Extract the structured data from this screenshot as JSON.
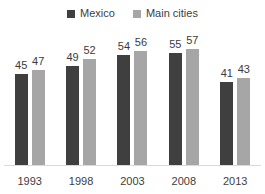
{
  "chart_data": {
    "type": "bar",
    "title": "",
    "categories": [
      "1993",
      "1998",
      "2003",
      "2008",
      "2013"
    ],
    "series": [
      {
        "name": "Mexico",
        "color": "#3f3f3f",
        "values": [
          45,
          49,
          54,
          55,
          41
        ]
      },
      {
        "name": "Main cities",
        "color": "#a6a6a6",
        "values": [
          47,
          52,
          56,
          57,
          43
        ]
      }
    ],
    "ylim": [
      0,
      60
    ],
    "grid": false,
    "legend_position": "top",
    "data_labels": true,
    "axis_line_color": "#d9d9d9"
  }
}
